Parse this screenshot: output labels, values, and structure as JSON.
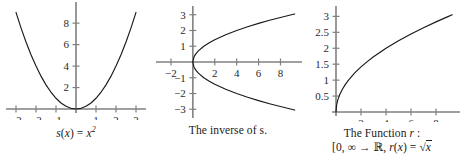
{
  "figure": {
    "panels": [
      {
        "id": "s",
        "caption_html": "s(x) = x2",
        "caption_plain": "s(x) = x²"
      },
      {
        "id": "inverse",
        "caption_plain": "The inverse of s."
      },
      {
        "id": "r",
        "caption_line1": "The Function r :",
        "caption_line2": "[0, ∞ → ℝ, r(x) = √x"
      }
    ]
  },
  "chart_data": [
    {
      "type": "line",
      "id": "parabola",
      "title": "s(x) = x²",
      "xlabel": "",
      "ylabel": "",
      "xlim": [
        -3.3,
        3.3
      ],
      "ylim": [
        0,
        9.6
      ],
      "grid": false,
      "legend": "none",
      "axis_color": "#808080",
      "curve_color": "#1a1a1a",
      "xticks": [
        -3,
        -2,
        -1,
        1,
        2,
        3
      ],
      "xtick_labels": [
        "−3",
        "−2",
        "−1",
        "1",
        "2",
        "3"
      ],
      "yticks": [
        2,
        4,
        6,
        8
      ],
      "ytick_labels": [
        "2",
        "4",
        "6",
        "8"
      ],
      "x": [
        -3,
        -2.75,
        -2.5,
        -2.25,
        -2,
        -1.75,
        -1.5,
        -1.25,
        -1,
        -0.75,
        -0.5,
        -0.25,
        0,
        0.25,
        0.5,
        0.75,
        1,
        1.25,
        1.5,
        1.75,
        2,
        2.25,
        2.5,
        2.75,
        3
      ],
      "y": [
        9,
        7.5625,
        6.25,
        5.0625,
        4,
        3.0625,
        2.25,
        1.5625,
        1,
        0.5625,
        0.25,
        0.0625,
        0,
        0.0625,
        0.25,
        0.5625,
        1,
        1.5625,
        2.25,
        3.0625,
        4,
        5.0625,
        6.25,
        7.5625,
        9
      ]
    },
    {
      "type": "line",
      "id": "inverse-parabola",
      "title": "The inverse of s.",
      "xlabel": "",
      "ylabel": "",
      "xlim": [
        -3,
        9.6
      ],
      "ylim": [
        -3.3,
        3.3
      ],
      "grid": false,
      "legend": "none",
      "axis_color": "#808080",
      "curve_color": "#1a1a1a",
      "xticks": [
        -2,
        2,
        4,
        6,
        8
      ],
      "xtick_labels": [
        "−2",
        "2",
        "4",
        "6",
        "8"
      ],
      "yticks": [
        -3,
        -2,
        -1,
        1,
        2,
        3
      ],
      "ytick_labels": [
        "−3",
        "−2",
        "−1",
        "1",
        "2",
        "3"
      ],
      "series": [
        {
          "name": "upper branch y = √x",
          "x": [
            0,
            0.1,
            0.25,
            0.5,
            1,
            1.5,
            2,
            3,
            4,
            5,
            6,
            7,
            8,
            9,
            9.3
          ],
          "y": [
            0,
            0.316,
            0.5,
            0.707,
            1,
            1.225,
            1.414,
            1.732,
            2,
            2.236,
            2.449,
            2.646,
            2.828,
            3,
            3.05
          ]
        },
        {
          "name": "lower branch y = −√x",
          "x": [
            0,
            0.1,
            0.25,
            0.5,
            1,
            1.5,
            2,
            3,
            4,
            5,
            6,
            7,
            8,
            9,
            9.3
          ],
          "y": [
            0,
            -0.316,
            -0.5,
            -0.707,
            -1,
            -1.225,
            -1.414,
            -1.732,
            -2,
            -2.236,
            -2.449,
            -2.646,
            -2.828,
            -3,
            -3.05
          ]
        }
      ]
    },
    {
      "type": "line",
      "id": "sqrt",
      "title": "The Function r : [0, ∞ → ℝ, r(x) = √x",
      "xlabel": "",
      "ylabel": "",
      "xlim": [
        0,
        9.6
      ],
      "ylim": [
        0,
        3.2
      ],
      "grid": false,
      "legend": "none",
      "axis_color": "#808080",
      "curve_color": "#1a1a1a",
      "xticks": [
        2,
        4,
        6,
        8
      ],
      "xtick_labels": [
        "2",
        "4",
        "6",
        "8"
      ],
      "yticks": [
        0.5,
        1,
        1.5,
        2,
        2.5,
        3
      ],
      "ytick_labels": [
        "0.5",
        "1",
        "1.5",
        "2",
        "2.5",
        "3"
      ],
      "x": [
        0,
        0.05,
        0.15,
        0.3,
        0.5,
        0.75,
        1,
        1.5,
        2,
        2.5,
        3,
        4,
        5,
        6,
        7,
        8,
        9,
        9.3
      ],
      "y": [
        0,
        0.224,
        0.387,
        0.548,
        0.707,
        0.866,
        1,
        1.225,
        1.414,
        1.581,
        1.732,
        2,
        2.236,
        2.449,
        2.646,
        2.828,
        3,
        3.05
      ]
    }
  ]
}
